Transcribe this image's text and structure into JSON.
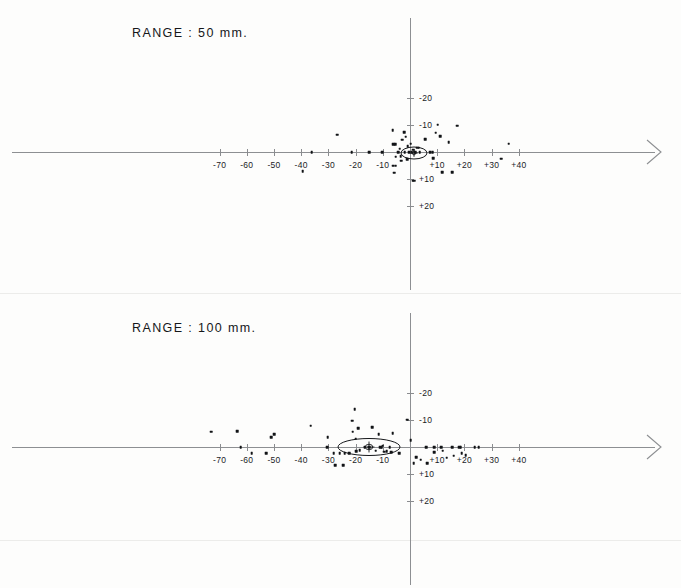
{
  "figure": {
    "background_color": "#fdfdfc",
    "axis_color": "#8d8f92",
    "point_color": "#111316",
    "text_color": "#1a1c1f"
  },
  "panels": [
    {
      "id": "panel-range-50",
      "title": "RANGE :   50 mm.",
      "title_x": 132,
      "title_y": 33,
      "origin_x": 410,
      "origin_y": 152,
      "px_per_unit_x": 2.72,
      "px_per_unit_y": 2.72,
      "x_axis_start": 12,
      "x_axis_end": 655,
      "y_axis_start": 18,
      "y_axis_end": 290,
      "x_ticks": [
        {
          "value": -70,
          "label": "-70"
        },
        {
          "value": -60,
          "label": "-60"
        },
        {
          "value": -50,
          "label": "-50"
        },
        {
          "value": -40,
          "label": "-40"
        },
        {
          "value": -30,
          "label": "-30"
        },
        {
          "value": -20,
          "label": "-20"
        },
        {
          "value": -10,
          "label": "-10"
        },
        {
          "value": 10,
          "label": "+10"
        },
        {
          "value": 20,
          "label": "+20"
        },
        {
          "value": 30,
          "label": "+30"
        },
        {
          "value": 40,
          "label": "+40"
        }
      ],
      "y_ticks": [
        {
          "value": -20,
          "label": "-20"
        },
        {
          "value": -10,
          "label": "-10"
        },
        {
          "value": 10,
          "label": "+10"
        },
        {
          "value": 20,
          "label": "+20"
        }
      ],
      "ellipse": {
        "center_x": 1.5,
        "center_y": 0.2,
        "width_px": 26,
        "height_px": 12,
        "rotation_deg": 0,
        "has_center_marker": true
      }
    },
    {
      "id": "panel-range-100",
      "title": "RANGE :  100 mm.",
      "title_x": 132,
      "title_y": 328,
      "origin_x": 410,
      "origin_y": 447,
      "px_per_unit_x": 2.72,
      "px_per_unit_y": 2.72,
      "x_axis_start": 12,
      "x_axis_end": 655,
      "y_axis_start": 313,
      "y_axis_end": 585,
      "x_ticks": [
        {
          "value": -70,
          "label": "-70"
        },
        {
          "value": -60,
          "label": "-60"
        },
        {
          "value": -50,
          "label": "-50"
        },
        {
          "value": -40,
          "label": "-40"
        },
        {
          "value": -30,
          "label": "-30"
        },
        {
          "value": -20,
          "label": "-20"
        },
        {
          "value": -10,
          "label": "-10"
        },
        {
          "value": 10,
          "label": "+10"
        },
        {
          "value": 20,
          "label": "+20"
        },
        {
          "value": 30,
          "label": "+30"
        },
        {
          "value": 40,
          "label": "+40"
        }
      ],
      "y_ticks": [
        {
          "value": -20,
          "label": "-20"
        },
        {
          "value": -10,
          "label": "-10"
        },
        {
          "value": 10,
          "label": "+10"
        },
        {
          "value": 20,
          "label": "+20"
        }
      ],
      "ellipse": {
        "center_x": -15.0,
        "center_y": 0.0,
        "width_px": 62,
        "height_px": 17,
        "rotation_deg": 0,
        "has_center_marker": true
      }
    }
  ],
  "chart_data": [
    {
      "type": "scatter",
      "title": "RANGE :   50 mm.",
      "xlabel": "",
      "ylabel": "",
      "xlim": [
        -75,
        48
      ],
      "ylim": [
        -22,
        22
      ],
      "y_axis_inverted": true,
      "grid": false,
      "legend": null,
      "annotations": [
        {
          "type": "ellipse",
          "cx": 1.5,
          "cy": 0.2,
          "rx_px": 13,
          "ry_px": 6
        }
      ],
      "points": [
        {
          "x": -36.2,
          "y": 0.0
        },
        {
          "x": -39.5,
          "y": 7.0
        },
        {
          "x": -26.8,
          "y": -6.4
        },
        {
          "x": -21.5,
          "y": 0.0
        },
        {
          "x": -15.0,
          "y": 0.0
        },
        {
          "x": -10.2,
          "y": 0.0
        },
        {
          "x": -6.4,
          "y": -8.0
        },
        {
          "x": -6.2,
          "y": -2.8
        },
        {
          "x": -5.4,
          "y": -2.8
        },
        {
          "x": -6.2,
          "y": 5.0
        },
        {
          "x": -5.2,
          "y": 5.0
        },
        {
          "x": -5.8,
          "y": 7.6
        },
        {
          "x": -5.3,
          "y": 1.8
        },
        {
          "x": -4.4,
          "y": 0.0
        },
        {
          "x": -3.8,
          "y": -1.2
        },
        {
          "x": -3.4,
          "y": 1.6
        },
        {
          "x": -3.2,
          "y": 3.2
        },
        {
          "x": -2.9,
          "y": -4.5
        },
        {
          "x": -2.2,
          "y": -7.3
        },
        {
          "x": -2.0,
          "y": 0.0
        },
        {
          "x": -1.6,
          "y": -5.6
        },
        {
          "x": -1.1,
          "y": 2.6
        },
        {
          "x": -0.9,
          "y": -2.2
        },
        {
          "x": -0.4,
          "y": 0.0
        },
        {
          "x": 0.3,
          "y": -3.0
        },
        {
          "x": 0.6,
          "y": 0.0
        },
        {
          "x": 1.2,
          "y": -0.9
        },
        {
          "x": 1.9,
          "y": 0.0
        },
        {
          "x": 2.6,
          "y": -1.6
        },
        {
          "x": 3.2,
          "y": -1.6
        },
        {
          "x": 3.6,
          "y": 0.0
        },
        {
          "x": 1.0,
          "y": 10.5
        },
        {
          "x": 1.6,
          "y": 10.5
        },
        {
          "x": 5.5,
          "y": -4.6
        },
        {
          "x": 7.4,
          "y": 0.0
        },
        {
          "x": 8.3,
          "y": 0.0
        },
        {
          "x": 8.6,
          "y": 2.2
        },
        {
          "x": 9.5,
          "y": -7.1
        },
        {
          "x": 10.2,
          "y": -10.0
        },
        {
          "x": 11.2,
          "y": -5.7
        },
        {
          "x": 11.8,
          "y": 7.4
        },
        {
          "x": 14.3,
          "y": -3.7
        },
        {
          "x": 15.6,
          "y": 7.4
        },
        {
          "x": 17.3,
          "y": -9.6
        },
        {
          "x": 33.6,
          "y": 2.5
        },
        {
          "x": 36.3,
          "y": -3.0
        }
      ]
    },
    {
      "type": "scatter",
      "title": "RANGE :  100 mm.",
      "xlabel": "",
      "ylabel": "",
      "xlim": [
        -75,
        48
      ],
      "ylim": [
        -22,
        22
      ],
      "y_axis_inverted": true,
      "grid": false,
      "legend": null,
      "annotations": [
        {
          "type": "ellipse",
          "cx": -15.0,
          "cy": 0.0,
          "rx_px": 31,
          "ry_px": 8.5
        }
      ],
      "points": [
        {
          "x": -73.0,
          "y": -5.6
        },
        {
          "x": -63.6,
          "y": -5.8
        },
        {
          "x": -62.3,
          "y": 0.0
        },
        {
          "x": -58.2,
          "y": 2.2
        },
        {
          "x": -51.0,
          "y": -3.6
        },
        {
          "x": -50.0,
          "y": -4.6
        },
        {
          "x": -52.8,
          "y": 2.2
        },
        {
          "x": -36.5,
          "y": -7.8
        },
        {
          "x": -30.5,
          "y": 0.0
        },
        {
          "x": -30.2,
          "y": -3.6
        },
        {
          "x": -28.0,
          "y": 2.3
        },
        {
          "x": -27.4,
          "y": 6.7
        },
        {
          "x": -25.8,
          "y": 2.2
        },
        {
          "x": -24.5,
          "y": 6.7
        },
        {
          "x": -24.0,
          "y": 2.2
        },
        {
          "x": -22.3,
          "y": 2.2
        },
        {
          "x": -21.3,
          "y": -9.7
        },
        {
          "x": -21.0,
          "y": -5.6
        },
        {
          "x": -20.3,
          "y": -13.8
        },
        {
          "x": -20.0,
          "y": -3.0
        },
        {
          "x": -19.8,
          "y": 1.6
        },
        {
          "x": -19.0,
          "y": -7.0
        },
        {
          "x": -18.5,
          "y": 1.2
        },
        {
          "x": -16.6,
          "y": 0.0
        },
        {
          "x": -15.0,
          "y": 0.0
        },
        {
          "x": -14.0,
          "y": -7.2
        },
        {
          "x": -12.6,
          "y": 1.4
        },
        {
          "x": -11.5,
          "y": -4.8
        },
        {
          "x": -11.0,
          "y": 0.0
        },
        {
          "x": -10.4,
          "y": 0.0
        },
        {
          "x": -10.0,
          "y": -0.5
        },
        {
          "x": -9.4,
          "y": 1.8
        },
        {
          "x": -8.5,
          "y": 1.6
        },
        {
          "x": -7.5,
          "y": 0.0
        },
        {
          "x": -7.0,
          "y": 1.9
        },
        {
          "x": -6.3,
          "y": -5.0
        },
        {
          "x": -4.0,
          "y": 2.2
        },
        {
          "x": -1.0,
          "y": -10.1
        },
        {
          "x": 0.3,
          "y": -2.6
        },
        {
          "x": 1.4,
          "y": 6.0
        },
        {
          "x": 2.2,
          "y": 3.8
        },
        {
          "x": 4.0,
          "y": 4.7
        },
        {
          "x": 6.0,
          "y": 0.0
        },
        {
          "x": 6.3,
          "y": 6.0
        },
        {
          "x": 8.8,
          "y": 0.0
        },
        {
          "x": 9.0,
          "y": 2.0
        },
        {
          "x": 11.5,
          "y": 0.0
        },
        {
          "x": 12.0,
          "y": 1.4
        },
        {
          "x": 13.5,
          "y": 4.0
        },
        {
          "x": 15.6,
          "y": 0.0
        },
        {
          "x": 16.0,
          "y": 3.2
        },
        {
          "x": 18.0,
          "y": 0.0
        },
        {
          "x": 18.6,
          "y": 0.0
        },
        {
          "x": 19.0,
          "y": 2.2
        },
        {
          "x": 20.5,
          "y": 3.0
        },
        {
          "x": 23.8,
          "y": 0.0
        },
        {
          "x": 25.2,
          "y": 0.0
        }
      ]
    }
  ]
}
